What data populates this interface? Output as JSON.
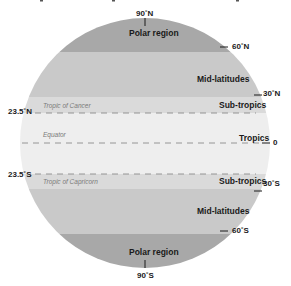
{
  "diagram": {
    "title_cut_off": true,
    "colors": {
      "polar": "#a8a8a8",
      "mid_latitudes": "#c9c9c9",
      "sub_tropics": "#dadada",
      "tropics": "#eeeeee",
      "dashed_line": "#8a8a8a",
      "tick": "#1a1a1a",
      "text": "#1a1a1a",
      "line_label": "#7a7a7a"
    },
    "latitude_labels": {
      "n90": "90˚N",
      "n60": "60˚N",
      "n30": "30˚N",
      "n23": "23.5˚N",
      "zero": "0",
      "s23": "23.5˚S",
      "s30": "30˚S",
      "s60": "60˚S",
      "s90": "90˚S"
    },
    "regions": {
      "polar_north": "Polar region",
      "mid_north": "Mid-latitudes",
      "sub_north": "Sub-tropics",
      "tropics": "Tropics",
      "sub_south": "Sub-tropics",
      "mid_south": "Mid-latitudes",
      "polar_south": "Polar region"
    },
    "lines": {
      "cancer": "Tropic of Cancer",
      "equator": "Equator",
      "capricorn": "Tropic of Capricorn"
    }
  }
}
